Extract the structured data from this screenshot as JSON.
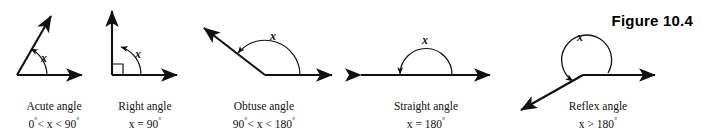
{
  "figure": {
    "number_label": "Figure 10.4",
    "angle_symbol": "x"
  },
  "diagrams": [
    {
      "id": "acute",
      "name": "Acute angle",
      "caption_line_1": "Acute angle",
      "caption_line_2_prefix": "0",
      "caption_line_2_mid": "< x < 90",
      "caption_line_2_suffix": "",
      "condition": "0°< x < 90°",
      "angle_label": "x"
    },
    {
      "id": "right",
      "name": "Right angle",
      "caption_line_1": "Right angle",
      "caption_line_2_prefix": "x = 90",
      "caption_line_2_mid": "",
      "caption_line_2_suffix": "",
      "condition": "x = 90°",
      "angle_label": "x"
    },
    {
      "id": "obtuse",
      "name": "Obtuse angle",
      "caption_line_1": "Obtuse angle",
      "caption_line_2_prefix": "90",
      "caption_line_2_mid": "< x < 180",
      "caption_line_2_suffix": "",
      "condition": "90°< x < 180°",
      "angle_label": "x"
    },
    {
      "id": "straight",
      "name": "Straight angle",
      "caption_line_1": "Straight angle",
      "caption_line_2_prefix": "x = 180",
      "caption_line_2_mid": "",
      "caption_line_2_suffix": "",
      "condition": "x = 180°",
      "angle_label": "x"
    },
    {
      "id": "reflex",
      "name": "Reflex angle",
      "caption_line_1": "Reflex angle",
      "caption_line_2_prefix": "x > 180",
      "caption_line_2_mid": "",
      "caption_line_2_suffix": "",
      "condition": "x > 180°",
      "angle_label": "x"
    }
  ],
  "colors": {
    "ink": "#111111",
    "background": "#ffffff"
  }
}
